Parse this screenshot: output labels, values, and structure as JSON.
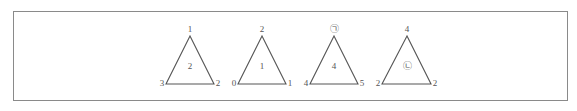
{
  "figure": {
    "stroke_color": "#555555",
    "frame_color": "#8a8a8a",
    "triangles": [
      {
        "top": "1",
        "bottom_left": "3",
        "bottom_right": "2",
        "center": "2"
      },
      {
        "top": "2",
        "bottom_left": "0",
        "bottom_right": "1",
        "center": "1"
      },
      {
        "top": "㉠",
        "bottom_left": "4",
        "bottom_right": "5",
        "center": "4"
      },
      {
        "top": "4",
        "bottom_left": "2",
        "bottom_right": "2",
        "center": "㉡"
      }
    ]
  }
}
